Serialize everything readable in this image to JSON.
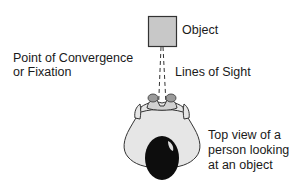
{
  "diagram": {
    "object_label": "Object",
    "convergence_label_line1": "Point of Convergence",
    "convergence_label_line2": "or Fixation",
    "lines_of_sight_label": "Lines of Sight",
    "person_caption_line1": "Top view of a",
    "person_caption_line2": "person looking",
    "person_caption_line3": "at an object",
    "colors": {
      "object_fill": "#c8c8c8",
      "object_stroke": "#333333",
      "body_fill": "#e6e6e6",
      "head_fill": "#0d0d0d",
      "eye_fill": "#9a9a9a",
      "text": "#1a1a1a"
    }
  }
}
